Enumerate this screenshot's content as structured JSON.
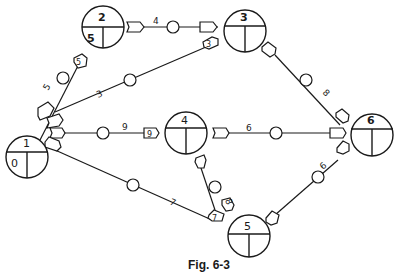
{
  "figure": {
    "caption": "Fig. 6-3",
    "type": "network diagram (activity-on-arrow with event nodes)"
  },
  "nodes": [
    {
      "id": "1",
      "label": "1",
      "value": "0",
      "cx": 27,
      "cy": 157
    },
    {
      "id": "2",
      "label": "2",
      "value": "5",
      "cx": 103,
      "cy": 25
    },
    {
      "id": "3",
      "label": "3",
      "value": "",
      "cx": 245,
      "cy": 27
    },
    {
      "id": "4",
      "label": "4",
      "value": "",
      "cx": 186,
      "cy": 130
    },
    {
      "id": "5",
      "label": "5",
      "value": "",
      "cx": 249,
      "cy": 240
    },
    {
      "id": "6",
      "label": "6",
      "value": "",
      "cx": 371,
      "cy": 160
    }
  ],
  "edges": [
    {
      "from": "1",
      "to": "2",
      "duration": "5",
      "end_tag": "5"
    },
    {
      "from": "1",
      "to": "3",
      "duration": "3",
      "end_tag": "3"
    },
    {
      "from": "1",
      "to": "4",
      "duration": "9",
      "end_tag": "9"
    },
    {
      "from": "1",
      "to": "5",
      "duration": "7",
      "end_tag": "7"
    },
    {
      "from": "2",
      "to": "3",
      "duration": "4",
      "end_tag": ""
    },
    {
      "from": "3",
      "to": "6",
      "duration": "8",
      "end_tag": ""
    },
    {
      "from": "4",
      "to": "6",
      "duration": "6",
      "end_tag": ""
    },
    {
      "from": "4",
      "to": "5",
      "duration": "8",
      "end_tag": ""
    },
    {
      "from": "5",
      "to": "6",
      "duration": "6",
      "end_tag": ""
    }
  ],
  "labels": {
    "n1_top": "1",
    "n1_bl": "0",
    "n2_top": "2",
    "n2_bl": "5",
    "n3_top": "3",
    "n4_top": "4",
    "n5_top": "5",
    "n6_top": "6",
    "e12": "5",
    "e12_tag": "5",
    "e13": "3",
    "e13_tag": "3",
    "e14": "9",
    "e14_tag": "9",
    "e15": "7",
    "e15_tag": "7",
    "e23": "4",
    "e36": "8",
    "e46": "6",
    "e45": "8",
    "e56": "6"
  }
}
